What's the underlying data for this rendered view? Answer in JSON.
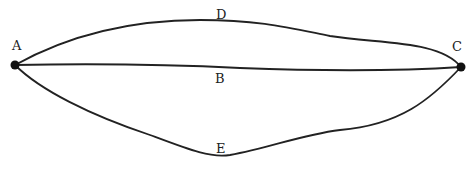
{
  "diagram": {
    "points": [
      {
        "id": "A",
        "label": "A",
        "x": 15,
        "y": 65
      },
      {
        "id": "C",
        "label": "C",
        "x": 461,
        "y": 67
      }
    ],
    "paths": [
      {
        "id": "D",
        "label": "D",
        "description": "upper curved path from A to C"
      },
      {
        "id": "B",
        "label": "B",
        "description": "nearly straight path from A to C"
      },
      {
        "id": "E",
        "label": "E",
        "description": "lower curved path from A to C"
      }
    ],
    "labels": {
      "A": "A",
      "B": "B",
      "C": "C",
      "D": "D",
      "E": "E"
    },
    "colors": {
      "ink": "#222222",
      "background": "#ffffff"
    }
  }
}
